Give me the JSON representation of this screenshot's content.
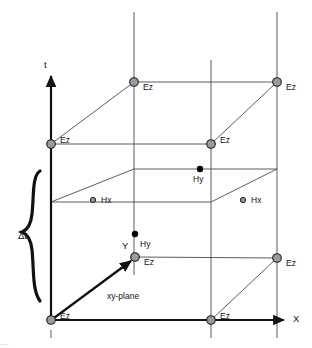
{
  "figure": {
    "kind": "fdtd-yee-spacetime-lattice",
    "axes": {
      "t_label": "t",
      "x_label": "X",
      "y_label": "Y"
    },
    "annotations": {
      "timestep_label": "Δt",
      "plane_label": "xy-plane"
    },
    "colors": {
      "node_fill": "#9a9a9a",
      "node_stroke": "#1a1a1a",
      "line": "#4a4a4a",
      "axis": "#111111",
      "point": "#000000",
      "background": "#ffffff",
      "text": "#111111"
    },
    "field_labels": {
      "ez": "Ez",
      "hx": "Hx",
      "hy": "Hy"
    },
    "nodes": [
      {
        "id": "ez-top-left",
        "label": "Ez",
        "x": 134,
        "y": 82,
        "type": "ez"
      },
      {
        "id": "ez-top-right",
        "label": "Ez",
        "x": 277,
        "y": 82,
        "type": "ez"
      },
      {
        "id": "ez-upper-front-left",
        "label": "Ez",
        "x": 51,
        "y": 144,
        "type": "ez"
      },
      {
        "id": "ez-upper-front-right",
        "label": "Ez",
        "x": 211,
        "y": 144,
        "type": "ez"
      },
      {
        "id": "ez-mid-back-left",
        "label": "Ez",
        "x": 135,
        "y": 257,
        "type": "ez"
      },
      {
        "id": "ez-mid-back-right",
        "label": "Ez",
        "x": 277,
        "y": 258,
        "type": "ez"
      },
      {
        "id": "ez-origin",
        "label": "Ez",
        "x": 51,
        "y": 320,
        "type": "ez"
      },
      {
        "id": "ez-bottom-right",
        "label": "Ez",
        "x": 211,
        "y": 320,
        "type": "ez"
      },
      {
        "id": "hx-left",
        "label": "Hx",
        "x": 93,
        "y": 200,
        "type": "hx"
      },
      {
        "id": "hx-right",
        "label": "Hx",
        "x": 243,
        "y": 200,
        "type": "hx"
      },
      {
        "id": "hy-upper",
        "label": "Hy",
        "x": 200,
        "y": 169,
        "type": "hy"
      },
      {
        "id": "hy-lower",
        "label": "Hy",
        "x": 135,
        "y": 234,
        "type": "hy"
      }
    ],
    "labels": [
      {
        "id": "label-t",
        "text": "t",
        "x": 44,
        "y": 60,
        "role": "axis"
      },
      {
        "id": "label-x",
        "text": "X",
        "x": 293,
        "y": 314,
        "role": "axis"
      },
      {
        "id": "label-y",
        "text": "Y",
        "x": 122,
        "y": 241,
        "role": "axis"
      },
      {
        "id": "label-dt",
        "text": "Δt",
        "x": 18,
        "y": 231,
        "role": "annotation"
      },
      {
        "id": "label-xy-plane",
        "text": "xy-plane",
        "x": 107,
        "y": 292,
        "role": "annotation"
      },
      {
        "id": "label-ez-1",
        "text": "Ez",
        "x": 143,
        "y": 83,
        "role": "field"
      },
      {
        "id": "label-ez-2",
        "text": "Ez",
        "x": 286,
        "y": 83,
        "role": "field"
      },
      {
        "id": "label-ez-3",
        "text": "Ez",
        "x": 60,
        "y": 136,
        "role": "field"
      },
      {
        "id": "label-ez-4",
        "text": "Ez",
        "x": 220,
        "y": 136,
        "role": "field"
      },
      {
        "id": "label-ez-5",
        "text": "Ez",
        "x": 144,
        "y": 258,
        "role": "field"
      },
      {
        "id": "label-ez-6",
        "text": "Ez",
        "x": 286,
        "y": 259,
        "role": "field"
      },
      {
        "id": "label-ez-7",
        "text": "Ez",
        "x": 60,
        "y": 312,
        "role": "field"
      },
      {
        "id": "label-ez-8",
        "text": "Ez",
        "x": 220,
        "y": 312,
        "role": "field"
      },
      {
        "id": "label-hx-1",
        "text": "Hx",
        "x": 101,
        "y": 196,
        "role": "field"
      },
      {
        "id": "label-hx-2",
        "text": "Hx",
        "x": 251,
        "y": 196,
        "role": "field"
      },
      {
        "id": "label-hy-1",
        "text": "Hy",
        "x": 193,
        "y": 175,
        "role": "field"
      },
      {
        "id": "label-hy-2",
        "text": "Hy",
        "x": 140,
        "y": 240,
        "role": "field"
      }
    ],
    "caption_remnant": "—"
  }
}
